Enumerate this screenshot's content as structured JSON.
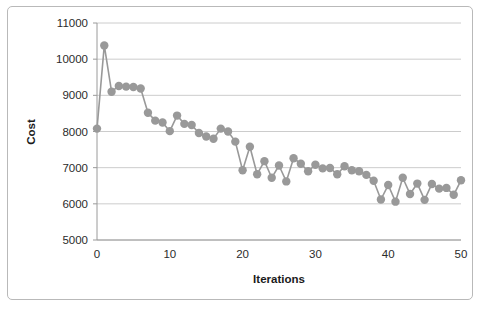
{
  "figure": {
    "border_color": "#b9b9b9",
    "background": "#ffffff"
  },
  "chart_data": {
    "type": "line",
    "title": "",
    "subtitle": "",
    "xlabel": "Iterations",
    "ylabel": "Cost",
    "xlim": [
      0,
      50
    ],
    "ylim": [
      5000,
      11000
    ],
    "ytick_labels": [
      "5000",
      "6000",
      "7000",
      "8000",
      "9000",
      "10000",
      "11000"
    ],
    "yticks": [
      5000,
      6000,
      7000,
      8000,
      9000,
      10000,
      11000
    ],
    "xtick_labels": [
      "0",
      "10",
      "20",
      "30",
      "40",
      "50"
    ],
    "xticks": [
      0,
      10,
      20,
      30,
      40,
      50
    ],
    "grid": "horizontal",
    "legend": "none",
    "series_color": "#999999",
    "marker": "circle",
    "marker_size": 4.2,
    "line_width": 1.6,
    "x": [
      0,
      1,
      2,
      3,
      4,
      5,
      6,
      7,
      8,
      9,
      10,
      11,
      12,
      13,
      14,
      15,
      16,
      17,
      18,
      19,
      20,
      21,
      22,
      23,
      24,
      25,
      26,
      27,
      28,
      29,
      30,
      31,
      32,
      33,
      34,
      35,
      36,
      37,
      38,
      39,
      40,
      41,
      42,
      43,
      44,
      45,
      46,
      47,
      48,
      49,
      50
    ],
    "values": [
      8080,
      10380,
      9100,
      9260,
      9240,
      9230,
      9190,
      8520,
      8300,
      8250,
      8010,
      8440,
      8210,
      8180,
      7960,
      7860,
      7800,
      8080,
      8000,
      7720,
      6930,
      7580,
      6820,
      7180,
      6720,
      7060,
      6620,
      7260,
      7110,
      6900,
      7080,
      6980,
      6990,
      6820,
      7040,
      6930,
      6900,
      6800,
      6640,
      6120,
      6520,
      6060,
      6720,
      6270,
      6560,
      6110,
      6550,
      6420,
      6440,
      6250,
      6650
    ]
  },
  "plot_geometry": {
    "left": 97,
    "right": 461,
    "top": 23,
    "bottom": 240
  }
}
